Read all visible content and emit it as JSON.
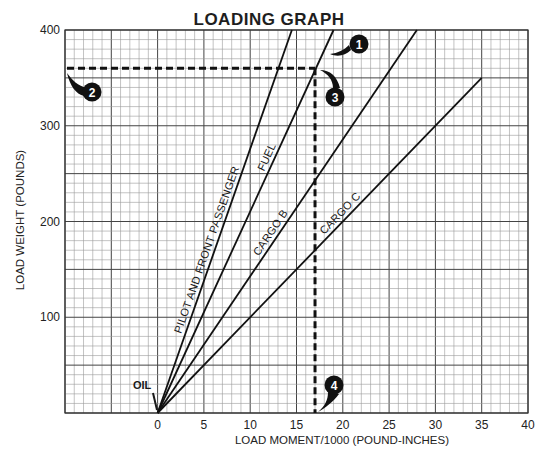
{
  "chart_data": {
    "type": "line",
    "title": "LOADING GRAPH",
    "xlabel": "LOAD MOMENT/1000 (POUND-INCHES)",
    "ylabel": "LOAD WEIGHT (POUNDS)",
    "xlim": [
      -10,
      40
    ],
    "ylim": [
      0,
      400
    ],
    "x_ticks": [
      0,
      5,
      10,
      15,
      20,
      25,
      30,
      35,
      40
    ],
    "y_ticks": [
      100,
      200,
      300,
      400
    ],
    "grid": {
      "on": true,
      "x_minor": 1,
      "x_major": 5,
      "y_minor": 10,
      "y_major": 50
    },
    "legend": "inline labels along lines",
    "series": [
      {
        "name": "PILOT AND FRONT PASSENGER",
        "x": [
          0,
          14.5
        ],
        "y": [
          0,
          400
        ]
      },
      {
        "name": "FUEL",
        "x": [
          0,
          19.0
        ],
        "y": [
          0,
          400
        ]
      },
      {
        "name": "CARGO B",
        "x": [
          0,
          28.0
        ],
        "y": [
          0,
          400
        ]
      },
      {
        "name": "CARGO C",
        "x": [
          0,
          35.0
        ],
        "y": [
          0,
          350
        ]
      }
    ],
    "annotations": [
      {
        "label": "OIL",
        "x": 0,
        "y": 0,
        "text": "OIL"
      },
      {
        "label": "1",
        "text": "Fuel line"
      },
      {
        "label": "2",
        "text": "Weight 360 lbs on vertical axis"
      },
      {
        "label": "3",
        "text": "Intersection of 360 lbs with fuel line"
      },
      {
        "label": "4",
        "text": "Moment ≈ 17 (x1000 lb-in)"
      }
    ],
    "reference_lines": [
      {
        "type": "horizontal",
        "y": 360,
        "x_from": -10,
        "x_to": 17,
        "style": "dashed"
      },
      {
        "type": "vertical",
        "x": 17,
        "y_from": 0,
        "y_to": 360,
        "style": "dashed"
      }
    ]
  },
  "labels": {
    "title": "LOADING GRAPH",
    "xlabel": "LOAD MOMENT/1000 (POUND-INCHES)",
    "ylabel": "LOAD WEIGHT (POUNDS)",
    "oil": "OIL",
    "markers": [
      "1",
      "2",
      "3",
      "4"
    ]
  }
}
